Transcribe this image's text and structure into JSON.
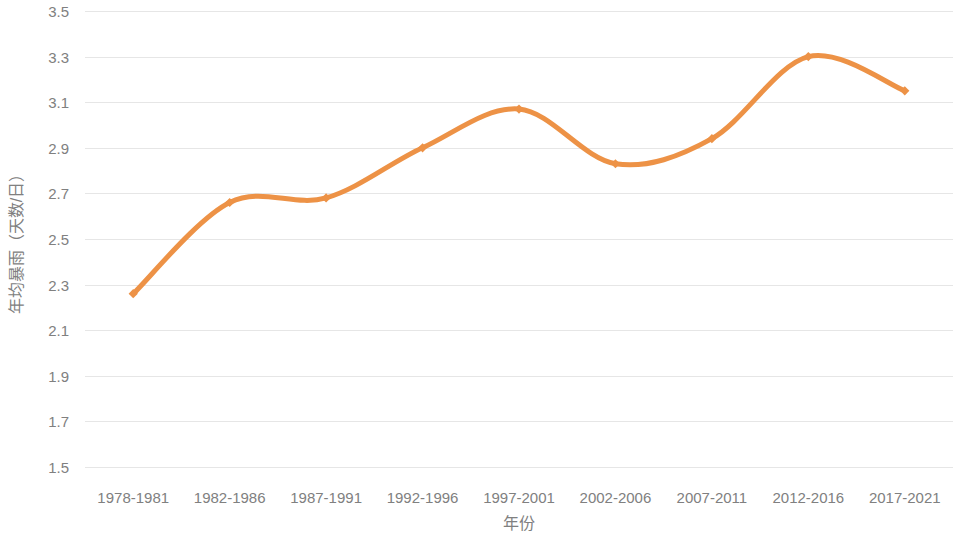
{
  "chart_data": {
    "type": "line",
    "title": "",
    "xlabel": "年份",
    "ylabel": "年均暴雨（天数/日）",
    "categories": [
      "1978-1981",
      "1982-1986",
      "1987-1991",
      "1992-1996",
      "1997-2001",
      "2002-2006",
      "2007-2011",
      "2012-2016",
      "2017-2021"
    ],
    "series": [
      {
        "name": "年均暴雨",
        "values": [
          2.26,
          2.66,
          2.68,
          2.9,
          3.07,
          2.83,
          2.94,
          3.3,
          3.15
        ]
      }
    ],
    "ylim": [
      1.5,
      3.5
    ],
    "ytick_step": 0.2,
    "ytick_labels": [
      "3.5",
      "3.3",
      "3.1",
      "2.9",
      "2.7",
      "2.5",
      "2.3",
      "2.1",
      "1.9",
      "1.7",
      "1.5"
    ],
    "ytick_values": [
      3.5,
      3.3,
      3.1,
      2.9,
      2.7,
      2.5,
      2.3,
      2.1,
      1.9,
      1.7,
      1.5
    ],
    "grid": true,
    "grid_axis": "y",
    "legend": false,
    "legend_position": "none",
    "smoothing": true,
    "marker": "diamond",
    "colors": {
      "series_line": "#ED9246",
      "marker_fill": "#ED9246",
      "gridline": "#e6e6e6",
      "tick_text": "#808080",
      "axis_title_text": "#808080",
      "background": "#ffffff"
    }
  }
}
